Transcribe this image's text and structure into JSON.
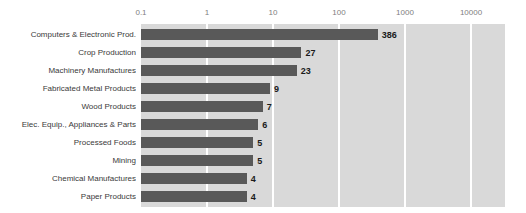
{
  "chart_data": {
    "type": "bar",
    "orientation": "horizontal",
    "title": "",
    "xlabel": "",
    "ylabel": "",
    "xscale": "log",
    "xlim": [
      0.1,
      10000
    ],
    "xticks": [
      "0.1",
      "1",
      "10",
      "100",
      "1000",
      "10000"
    ],
    "grid": true,
    "legend": "none",
    "categories": [
      "Computers & Electronic Prod.",
      "Crop Production",
      "Machinery Manufactures",
      "Fabricated Metal Products",
      "Wood Products",
      "Elec. Equip., Appliances & Parts",
      "Processed Foods",
      "Mining",
      "Chemical Manufactures",
      "Paper Products"
    ],
    "values": [
      386,
      27,
      23,
      9,
      7,
      6,
      5,
      5,
      4,
      4
    ],
    "value_labels": [
      "386",
      "27",
      "23",
      "9",
      "7",
      "6",
      "5",
      "5",
      "4",
      "4"
    ]
  },
  "style": {
    "bar_color": "#595959",
    "plot_background": "#d9d9d9",
    "gridline_color": "#ffffff",
    "tick_label_color": "#808080",
    "category_label_color": "#3a3a3a",
    "value_label_color": "#1a1a1a",
    "page_background": "#ffffff"
  }
}
